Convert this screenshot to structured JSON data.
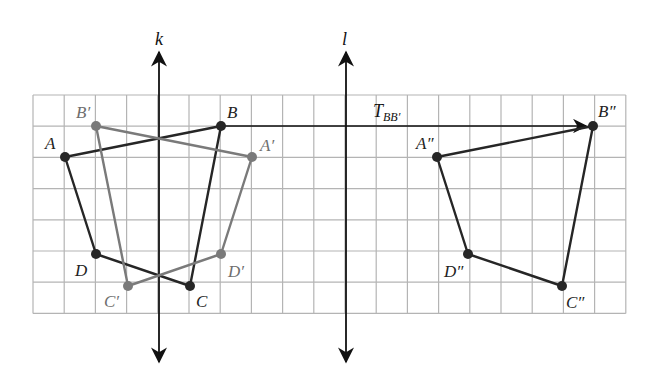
{
  "diagram": {
    "grid": {
      "left": 33,
      "top": 95,
      "cell": 31.2,
      "cols": 19,
      "rows": 7,
      "color": "#b4b4b4"
    },
    "colors": {
      "original": "#262626",
      "first_image": "#7a7a7a",
      "second_image": "#262626",
      "axis": "#111111"
    },
    "lines": [
      {
        "id": "k",
        "label": "k",
        "x": 159,
        "y_top": 52,
        "y_bottom": 362
      },
      {
        "id": "l",
        "label": "l",
        "x": 346,
        "y_top": 52,
        "y_bottom": 362
      }
    ],
    "translation_arrow": {
      "label_main": "T",
      "label_sub": "BB′",
      "from": [
        221,
        126
      ],
      "to": [
        593,
        126
      ]
    },
    "polygons": [
      {
        "name": "ABCD",
        "style": "original",
        "vertices": [
          {
            "label": "A",
            "x": 65,
            "y": 157,
            "lx": 45,
            "ly": 135
          },
          {
            "label": "B",
            "x": 221,
            "y": 126,
            "lx": 227,
            "ly": 104
          },
          {
            "label": "C",
            "x": 190,
            "y": 286,
            "lx": 196,
            "ly": 293
          },
          {
            "label": "D",
            "x": 96,
            "y": 254,
            "lx": 75,
            "ly": 262
          }
        ]
      },
      {
        "name": "A′B′C′D′",
        "style": "first_image",
        "vertices": [
          {
            "label": "A′",
            "x": 252,
            "y": 157,
            "lx": 260,
            "ly": 137
          },
          {
            "label": "B′",
            "x": 96,
            "y": 126,
            "lx": 76,
            "ly": 104
          },
          {
            "label": "C′",
            "x": 128,
            "y": 286,
            "lx": 104,
            "ly": 293
          },
          {
            "label": "D′",
            "x": 221,
            "y": 254,
            "lx": 228,
            "ly": 263
          }
        ]
      },
      {
        "name": "A″B″C″D″",
        "style": "second_image",
        "vertices": [
          {
            "label": "A″",
            "x": 437,
            "y": 157,
            "lx": 416,
            "ly": 135
          },
          {
            "label": "B″",
            "x": 593,
            "y": 126,
            "lx": 598,
            "ly": 103
          },
          {
            "label": "C″",
            "x": 562,
            "y": 286,
            "lx": 566,
            "ly": 294
          },
          {
            "label": "D″",
            "x": 468,
            "y": 254,
            "lx": 444,
            "ly": 263
          }
        ]
      }
    ]
  }
}
